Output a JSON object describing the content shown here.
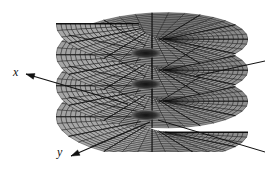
{
  "figure": {
    "kind": "riemann-surface-helicoid",
    "caption": "",
    "background_color": "#ffffff",
    "surface": {
      "fill_color": "#9a9a9a",
      "fill_color_light": "#bdbdbd",
      "fill_color_dark": "#6e6e6e",
      "mesh_line_color": "#141414",
      "edge_color": "#000000",
      "sheet_count": 4,
      "turns": 3.5,
      "radial_divisions": 16,
      "angular_divisions": 36,
      "center_hole_color": "#1a1a1a"
    },
    "axes": [
      {
        "name": "x-axis",
        "label": "x",
        "label_x": 13,
        "label_y": 66,
        "arrow_from": [
          128,
          104
        ],
        "arrow_to": [
          26,
          74
        ],
        "color": "#111111"
      },
      {
        "name": "y-axis",
        "label": "y",
        "label_x": 57,
        "label_y": 146,
        "arrow_from": [
          150,
          122
        ],
        "arrow_to": [
          71,
          156
        ],
        "color": "#111111"
      }
    ],
    "plain_lines": [
      {
        "name": "upper-right-ray",
        "from": [
          196,
          76
        ],
        "to": [
          265,
          61
        ],
        "color": "#111111"
      },
      {
        "name": "lower-right-ray",
        "from": [
          158,
          120
        ],
        "to": [
          265,
          152
        ],
        "color": "#111111"
      }
    ]
  }
}
